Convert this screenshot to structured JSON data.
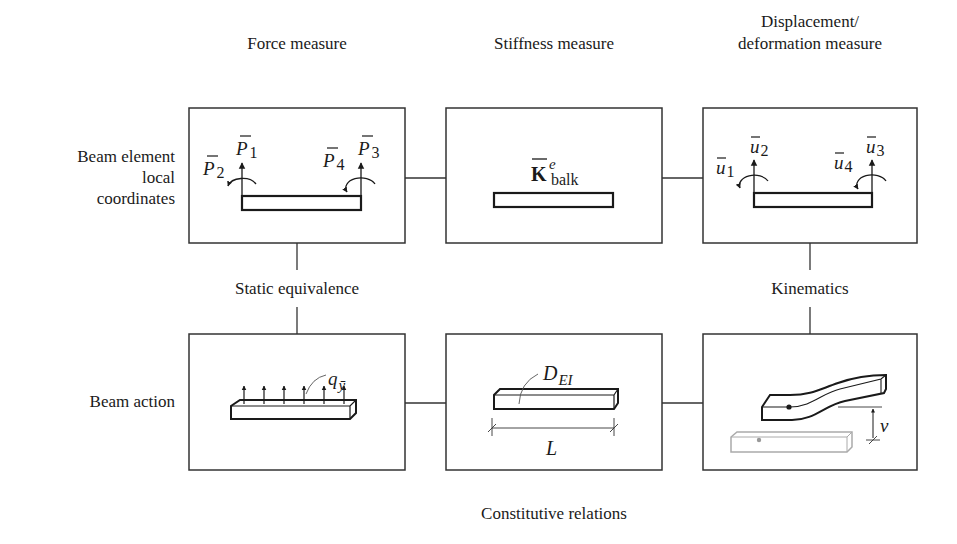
{
  "column_headers": [
    {
      "id": "force",
      "lines": [
        "Force measure"
      ]
    },
    {
      "id": "stiffness",
      "lines": [
        "Stiffness measure"
      ]
    },
    {
      "id": "displacement",
      "lines": [
        "Displacement/",
        "deformation measure"
      ]
    }
  ],
  "row_labels": [
    {
      "id": "beam-element-local",
      "lines": [
        "Beam element",
        "local",
        "coordinates"
      ]
    },
    {
      "id": "beam-action",
      "lines": [
        "Beam action"
      ]
    }
  ],
  "relations": {
    "static_equivalence": "Static equivalence",
    "kinematics": "Kinematics",
    "constitutive": "Constitutive relations"
  },
  "boxes": {
    "force_local": {
      "symbols": [
        {
          "base": "P",
          "sub": "1",
          "bar": true
        },
        {
          "base": "P",
          "sub": "2",
          "bar": true
        },
        {
          "base": "P",
          "sub": "3",
          "bar": true
        },
        {
          "base": "P",
          "sub": "4",
          "bar": true
        }
      ]
    },
    "stiffness_local": {
      "symbol": {
        "base": "K",
        "sup": "e",
        "sub": "balk",
        "bar": true,
        "bold": true
      }
    },
    "displacement_local": {
      "symbols": [
        {
          "base": "u",
          "sub": "1",
          "bar": true
        },
        {
          "base": "u",
          "sub": "2",
          "bar": true
        },
        {
          "base": "u",
          "sub": "3",
          "bar": true
        },
        {
          "base": "u",
          "sub": "4",
          "bar": true
        }
      ]
    },
    "force_action": {
      "symbol": {
        "base": "q",
        "sub": "ȳ"
      },
      "arrow_count": 6
    },
    "stiffness_action": {
      "symbol": {
        "base": "D",
        "sub": "EI"
      },
      "length_label": "L"
    },
    "displacement_action": {
      "deflection_label": "v"
    }
  },
  "colors": {
    "line": "#333333",
    "faded": "#9a9a9a"
  }
}
